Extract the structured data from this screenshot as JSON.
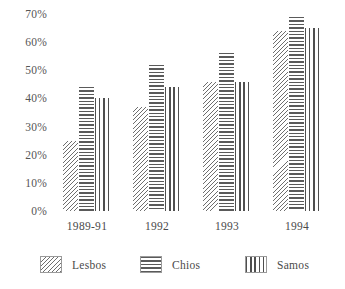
{
  "chart_data": {
    "type": "bar",
    "title": "",
    "subtitle": "",
    "xlabel": "",
    "ylabel": "",
    "categories": [
      "1989-91",
      "1992",
      "1993",
      "1994"
    ],
    "series": [
      {
        "name": "Lesbos",
        "pattern": "diagonal-hatch",
        "values": [
          25,
          37,
          46,
          64
        ]
      },
      {
        "name": "Chios",
        "pattern": "horizontal-lines",
        "values": [
          44,
          52,
          56,
          69
        ]
      },
      {
        "name": "Samos",
        "pattern": "vertical-lines",
        "values": [
          40,
          44,
          46,
          65
        ]
      }
    ],
    "ylim": [
      0,
      70
    ],
    "ytick_values": [
      70,
      60,
      50,
      40,
      30,
      20,
      10,
      0
    ],
    "ytick_labels": [
      "70%",
      "60%",
      "50%",
      "40%",
      "30%",
      "20%",
      "10%",
      "0%"
    ],
    "grid": false,
    "legend_position": "bottom",
    "colors": {
      "lesbos": "#6e6e6e",
      "chios": "#5a5a5a",
      "samos": "#4f4f4f",
      "text": "#4a4a4a",
      "background": "#ffffff"
    }
  }
}
